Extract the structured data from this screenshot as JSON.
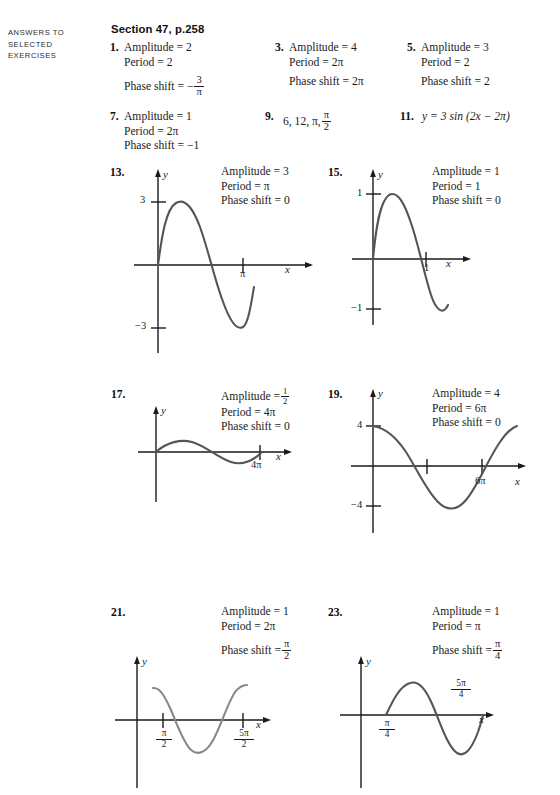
{
  "page": {
    "running_head_lines": [
      "ANSWERS TO",
      "SELECTED",
      "EXERCISES"
    ],
    "section_title": "Section 47, p.258"
  },
  "labels": {
    "amplitude": "Amplitude =",
    "period": "Period =",
    "phase_shift": "Phase shift ="
  },
  "answers": [
    {
      "number": "1.",
      "amplitude": "2",
      "period": "2",
      "phase_shift_prefix": "−",
      "phase_shift_num": "3",
      "phase_shift_den": "π"
    },
    {
      "number": "3.",
      "amplitude": "4",
      "period": "2π",
      "phase_shift": "2π"
    },
    {
      "number": "5.",
      "amplitude": "3",
      "period": "2",
      "phase_shift": "2"
    },
    {
      "number": "7.",
      "amplitude": "1",
      "period": "2π",
      "phase_shift": "−1"
    },
    {
      "number": "9.",
      "text": "6, 12, π,",
      "frac_num": "π",
      "frac_den": "2"
    },
    {
      "number": "11.",
      "text": "y = 3 sin (2x − 2π)"
    },
    {
      "number": "13.",
      "amplitude": "3",
      "period": "π",
      "phase_shift": "0",
      "graph": {
        "y_axis_label": "y",
        "x_axis_label": "x",
        "y_tick_labels": [
          "3",
          "−3"
        ],
        "x_tick_labels": [
          "π"
        ],
        "curve": "y = 3 sin(2x)"
      }
    },
    {
      "number": "15.",
      "amplitude": "1",
      "period": "1",
      "phase_shift": "0",
      "graph": {
        "y_axis_label": "y",
        "x_axis_label": "x",
        "y_tick_labels": [
          "1",
          "−1"
        ],
        "x_tick_labels": [
          "1"
        ],
        "curve": "y = sin(2πx)"
      }
    },
    {
      "number": "17.",
      "amplitude_num": "1",
      "amplitude_den": "2",
      "period": "4π",
      "phase_shift": "0",
      "graph": {
        "y_axis_label": "y",
        "x_axis_label": "x",
        "x_tick_labels": [
          "4π"
        ],
        "curve": "y = (1/2) sin(x/2)"
      }
    },
    {
      "number": "19.",
      "amplitude": "4",
      "period": "6π",
      "phase_shift": "0",
      "graph": {
        "y_axis_label": "y",
        "x_axis_label": "x",
        "y_tick_labels": [
          "4",
          "−4"
        ],
        "x_tick_labels": [
          "6π"
        ],
        "curve": "y = 4 cos(x/3)"
      }
    },
    {
      "number": "21.",
      "amplitude": "1",
      "period": "2π",
      "phase_shift_num": "π",
      "phase_shift_den": "2",
      "graph": {
        "y_axis_label": "y",
        "x_axis_label": "x",
        "x_tick_fracs": [
          {
            "n": "π",
            "d": "2"
          },
          {
            "n": "5π",
            "d": "2"
          }
        ],
        "curve": "y = cos(x − π/2)"
      }
    },
    {
      "number": "23.",
      "amplitude": "1",
      "period": "π",
      "phase_shift_num": "π",
      "phase_shift_den": "4",
      "graph": {
        "y_axis_label": "y",
        "x_axis_label": "x",
        "x_tick_fracs": [
          {
            "n": "π",
            "d": "4"
          },
          {
            "n": "5π",
            "d": "4"
          }
        ],
        "curve": "y = sin(2x − π/2)"
      }
    }
  ],
  "colors": {
    "ink": "#1b1b1b",
    "curve": "#555555",
    "axis": "#1a1a1a"
  }
}
